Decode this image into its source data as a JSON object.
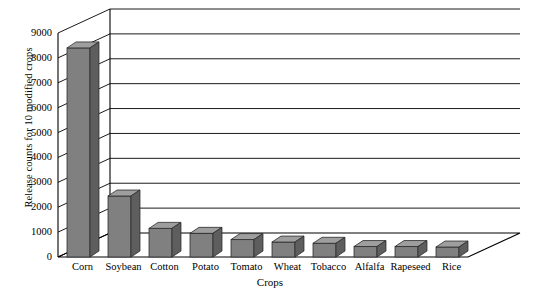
{
  "chart_data": {
    "type": "bar",
    "title": "",
    "subtitle": "",
    "xlabel": "Crops",
    "ylabel": "Release counts for 10 modified crops",
    "categories": [
      "Corn",
      "Soybean",
      "Cotton",
      "Potato",
      "Tomato",
      "Wheat",
      "Tobacco",
      "Alfalfa",
      "Rapeseed",
      "Rice"
    ],
    "values": [
      8400,
      2450,
      1150,
      950,
      700,
      600,
      550,
      420,
      420,
      400
    ],
    "ylim": [
      0,
      9000
    ],
    "ytick_values": [
      0,
      1000,
      2000,
      3000,
      4000,
      5000,
      6000,
      7000,
      8000,
      9000
    ],
    "ytick_labels": [
      "0",
      "1000",
      "2000",
      "3000",
      "4000",
      "5000",
      "6000",
      "7000",
      "8000",
      "9000"
    ],
    "grid": true,
    "legend": false,
    "legend_position": "none",
    "style": "3d-bar",
    "colors": {
      "bar_front": "#808080",
      "bar_side": "#5e5e5e",
      "bar_top": "#9e9e9e",
      "axis": "#000000",
      "grid": "#000000",
      "background": "#ffffff"
    }
  }
}
